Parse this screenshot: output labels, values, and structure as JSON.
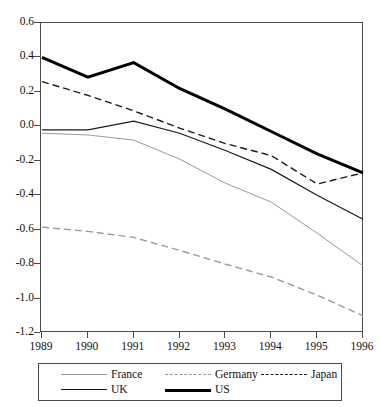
{
  "title_sliver": "· · ·",
  "chart_data": {
    "type": "line",
    "title": "",
    "xlabel": "",
    "ylabel": "",
    "x": [
      1989,
      1990,
      1991,
      1992,
      1993,
      1994,
      1995,
      1996
    ],
    "xtick_labels": [
      "1989",
      "1990",
      "1991",
      "1992",
      "1993",
      "1994",
      "1995",
      "1996"
    ],
    "ytick_labels": [
      "0.6",
      "0.4",
      "0.2",
      "0.0",
      "-0.2",
      "-0.4",
      "-0.6",
      "-0.8",
      "-1.0",
      "-1.2"
    ],
    "ytick_values": [
      0.6,
      0.4,
      0.2,
      0.0,
      -0.2,
      -0.4,
      -0.6,
      -0.8,
      -1.0,
      -1.2
    ],
    "ylim": [
      -1.2,
      0.6
    ],
    "xlim": [
      1989,
      1996
    ],
    "grid": false,
    "legend_position": "below",
    "series": [
      {
        "name": "France",
        "style": "solid",
        "color": "#9a9a9a",
        "width": 1.0,
        "values": [
          -0.04,
          -0.05,
          -0.08,
          -0.19,
          -0.33,
          -0.44,
          -0.62,
          -0.81
        ]
      },
      {
        "name": "Germany",
        "style": "dashed",
        "color": "#9a9a9a",
        "width": 1.4,
        "values": [
          -0.585,
          -0.61,
          -0.645,
          -0.72,
          -0.8,
          -0.875,
          -0.98,
          -1.1
        ]
      },
      {
        "name": "Japan",
        "style": "dashed",
        "color": "#1a1a1a",
        "width": 1.4,
        "values": [
          0.26,
          0.18,
          0.09,
          -0.01,
          -0.1,
          -0.17,
          -0.335,
          -0.27
        ]
      },
      {
        "name": "UK",
        "style": "solid",
        "color": "#1a1a1a",
        "width": 1.2,
        "values": [
          -0.02,
          -0.02,
          0.03,
          -0.04,
          -0.14,
          -0.25,
          -0.4,
          -0.54
        ]
      },
      {
        "name": "US",
        "style": "solid",
        "color": "#000000",
        "width": 3.0,
        "values": [
          0.4,
          0.285,
          0.37,
          0.22,
          0.1,
          -0.03,
          -0.16,
          -0.27
        ]
      }
    ]
  },
  "legend": {
    "items": [
      {
        "label": "France",
        "key": "france"
      },
      {
        "label": "Germany",
        "key": "germany"
      },
      {
        "label": "Japan",
        "key": "japan"
      },
      {
        "label": "UK",
        "key": "uk"
      },
      {
        "label": "US",
        "key": "us"
      }
    ]
  }
}
